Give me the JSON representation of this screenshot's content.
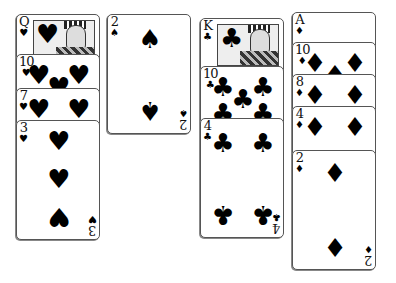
{
  "game": "Solitaire (foundation/tableau view)",
  "columns": [
    {
      "suit": "hearts",
      "cards": [
        {
          "rank": "Q",
          "suit_glyph": "♥",
          "top": 14,
          "left": 16,
          "face": true
        },
        {
          "rank": "10",
          "suit_glyph": "♥",
          "top": 54,
          "left": 16
        },
        {
          "rank": "7",
          "suit_glyph": "♥",
          "top": 88,
          "left": 16
        },
        {
          "rank": "3",
          "suit_glyph": "♥",
          "top": 120,
          "left": 16
        }
      ]
    },
    {
      "suit": "spades",
      "cards": [
        {
          "rank": "2",
          "suit_glyph": "♠",
          "top": 14,
          "left": 107
        }
      ]
    },
    {
      "suit": "clubs",
      "cards": [
        {
          "rank": "K",
          "suit_glyph": "♣",
          "top": 18,
          "left": 200,
          "face": true
        },
        {
          "rank": "10",
          "suit_glyph": "♣",
          "top": 66,
          "left": 200
        },
        {
          "rank": "4",
          "suit_glyph": "♣",
          "top": 118,
          "left": 200
        }
      ]
    },
    {
      "suit": "diamonds",
      "cards": [
        {
          "rank": "A",
          "suit_glyph": "♦",
          "top": 12,
          "left": 292
        },
        {
          "rank": "10",
          "suit_glyph": "♦",
          "top": 42,
          "left": 292
        },
        {
          "rank": "8",
          "suit_glyph": "♦",
          "top": 74,
          "left": 292
        },
        {
          "rank": "4",
          "suit_glyph": "♦",
          "top": 106,
          "left": 292
        },
        {
          "rank": "2",
          "suit_glyph": "♦",
          "top": 150,
          "left": 292
        }
      ]
    }
  ],
  "labels": {
    "qh": {
      "rank": "Q",
      "suit": "♥"
    },
    "th": {
      "rank": "10",
      "suit": "♥"
    },
    "sh": {
      "rank": "7",
      "suit": "♥"
    },
    "h3": {
      "rank": "3",
      "suit": "♥"
    },
    "s2": {
      "rank": "2",
      "suit": "♠"
    },
    "kc": {
      "rank": "K",
      "suit": "♣"
    },
    "tc": {
      "rank": "10",
      "suit": "♣"
    },
    "c4": {
      "rank": "4",
      "suit": "♣"
    },
    "ad": {
      "rank": "A",
      "suit": "♦"
    },
    "td": {
      "rank": "10",
      "suit": "♦"
    },
    "ed": {
      "rank": "8",
      "suit": "♦"
    },
    "d4": {
      "rank": "4",
      "suit": "♦"
    },
    "d2": {
      "rank": "2",
      "suit": "♦"
    }
  }
}
